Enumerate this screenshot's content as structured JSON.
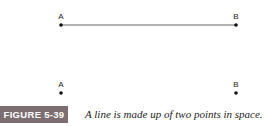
{
  "figure": {
    "label": "FIGURE 5-39",
    "caption": "A line is made up of two points in space.",
    "label_color": "#7c6e70"
  },
  "top_pair": {
    "connected": true,
    "points": [
      {
        "label": "A"
      },
      {
        "label": "B"
      }
    ]
  },
  "bottom_pair": {
    "connected": false,
    "points": [
      {
        "label": "A"
      },
      {
        "label": "B"
      }
    ]
  }
}
